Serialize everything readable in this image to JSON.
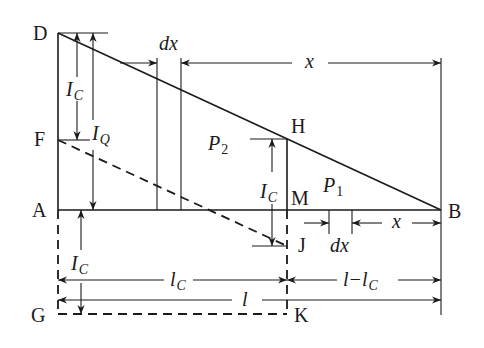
{
  "diagram": {
    "points": {
      "D": "D",
      "F": "F",
      "A": "A",
      "G": "G",
      "H": "H",
      "M": "M",
      "J": "J",
      "K": "K",
      "B": "B"
    },
    "labels": {
      "IC_top": {
        "main": "I",
        "sub": "C"
      },
      "IQ": {
        "main": "I",
        "sub": "Q"
      },
      "IC_mid": {
        "main": "I",
        "sub": "C"
      },
      "IC_bottom": {
        "main": "I",
        "sub": "C"
      },
      "P2": {
        "main": "P",
        "sub": "2"
      },
      "P1": {
        "main": "P",
        "sub": "1"
      },
      "dx_top": "dx",
      "dx_bottom": "dx",
      "x_top": "x",
      "x_bottom": "x",
      "lC": {
        "main": "l",
        "sub": "C"
      },
      "l": "l",
      "l_minus_lC": {
        "main": "l−l",
        "sub": "C"
      }
    }
  }
}
